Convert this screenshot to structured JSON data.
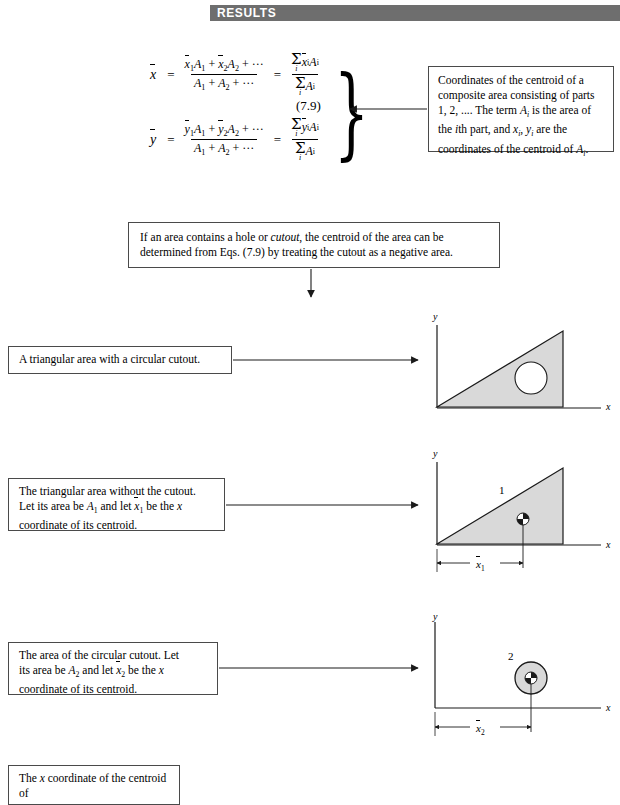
{
  "header": {
    "banner_label": "RESULTS",
    "banner_color": "#6e6e6e"
  },
  "equations": {
    "number": "(7.9)",
    "xbar": {
      "lhs": "x",
      "numerator": "ẍ1A1 + ẍ2A2 + ···",
      "denominator": "A1 + A2 + ···",
      "rhs_numerator": "Σi ẍi Ai",
      "rhs_denominator": "Σi Ai"
    },
    "ybar": {
      "lhs": "y",
      "numerator": "ÿ1A1 + ÿ2A2 + ···",
      "denominator": "A1 + A2 + ···",
      "rhs_numerator": "Σi ÿi Ai",
      "rhs_denominator": "Σi Ai"
    }
  },
  "callouts": {
    "coordinates": {
      "line1_a": "Coordinates of the centroid of a",
      "line2_a": "composite area consisting of parts",
      "line3_a": "1, 2, .... The term ",
      "line3_b": "A",
      "line3_c": "i",
      "line3_d": " is the area of",
      "line4_a": "the ",
      "line4_b": "i",
      "line4_c": "th part, and ",
      "line4_d": "x",
      "line4_e": "i",
      "line4_f": ", ",
      "line4_g": "y",
      "line4_h": "i",
      "line4_i": " are the",
      "line5_a": "coordinates of the centroid of ",
      "line5_b": "A",
      "line5_c": "i",
      "line5_d": "."
    },
    "cutout_rule": {
      "line1_a": "If an area contains a hole or ",
      "line1_b": "cutout",
      "line1_c": ", the centroid of the area can be",
      "line2": "determined from Eqs. (7.9) by treating the cutout as a negative area."
    },
    "triangle_with_cutout": {
      "text": "A triangular area with a circular cutout."
    },
    "triangle_without_cutout": {
      "line1": "The triangular area without the cutout.",
      "line2_a": "Let its area be ",
      "line2_b": "A",
      "line2_c": "1",
      "line2_d": " and let ",
      "line2_e": "x",
      "line2_f": "1",
      "line2_g": " be the ",
      "line2_h": "x",
      "line3": "coordinate of its centroid."
    },
    "circular_cutout": {
      "line1": "The area of the circular cutout. Let",
      "line2_a": "its area be ",
      "line2_b": "A",
      "line2_c": "2",
      "line2_d": " and let ",
      "line2_e": "x",
      "line2_f": "2",
      "line2_g": " be the ",
      "line2_h": "x",
      "line3": "coordinate of its centroid."
    },
    "x_coordinate": {
      "line1_a": "The ",
      "line1_b": "x",
      "line1_c": " coordinate of the centroid of"
    }
  },
  "figures": {
    "fig1": {
      "y_axis_label": "y",
      "x_axis_label": "x",
      "description": "triangle with circular hole"
    },
    "fig2": {
      "y_axis_label": "y",
      "x_axis_label": "x",
      "part_label": "1",
      "dimension_label_base": "x",
      "dimension_label_sub": "1"
    },
    "fig3": {
      "y_axis_label": "y",
      "x_axis_label": "x",
      "part_label": "2",
      "dimension_label_base": "x",
      "dimension_label_sub": "2"
    }
  },
  "colors": {
    "shape_fill": "#d9d9d9",
    "line": "#1a1a1a",
    "box_border": "#4a4a4a"
  }
}
